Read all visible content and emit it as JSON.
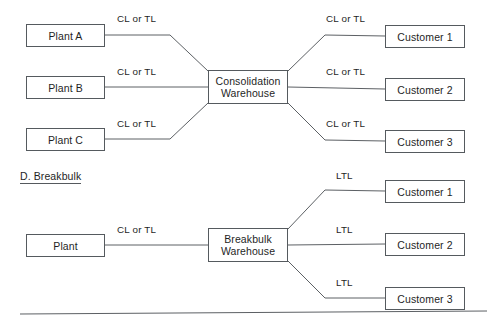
{
  "page": {
    "background_color": "#ffffff",
    "line_color": "#5c6064",
    "text_color": "#1f1f1f",
    "width": 493,
    "height": 328
  },
  "section_heading": {
    "label": "D. Breakbulk"
  },
  "diagrams": [
    {
      "id": "consolidation",
      "hub": {
        "label": "Consolidation\nWarehouse"
      },
      "sources": [
        {
          "label": "Plant A",
          "edge_label": "CL or TL"
        },
        {
          "label": "Plant B",
          "edge_label": "CL or TL"
        },
        {
          "label": "Plant C",
          "edge_label": "CL or TL"
        }
      ],
      "destinations": [
        {
          "label": "Customer 1",
          "edge_label": "CL or TL"
        },
        {
          "label": "Customer 2",
          "edge_label": "CL or TL"
        },
        {
          "label": "Customer 3",
          "edge_label": "CL or TL"
        }
      ]
    },
    {
      "id": "breakbulk",
      "hub": {
        "label": "Breakbulk\nWarehouse"
      },
      "sources": [
        {
          "label": "Plant",
          "edge_label": "CL or TL"
        }
      ],
      "destinations": [
        {
          "label": "Customer 1",
          "edge_label": "LTL"
        },
        {
          "label": "Customer 2",
          "edge_label": "LTL"
        },
        {
          "label": "Customer 3",
          "edge_label": "LTL"
        }
      ]
    }
  ]
}
